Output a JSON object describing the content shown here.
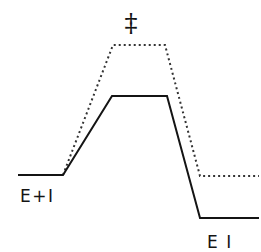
{
  "figure": {
    "name": "reaction-coordinate-diagram",
    "type": "energy-profile",
    "background_color": "#ffffff",
    "line_color": "#141414",
    "dotted_color": "#333333",
    "width": 261,
    "height": 252
  },
  "labels": {
    "transition_state": "‡",
    "reactants": "E+I",
    "products": "E I"
  },
  "label_positions": {
    "transition_state": {
      "x": 131,
      "y": 32
    },
    "reactants": {
      "x": 20,
      "y": 202
    },
    "products": {
      "x": 207,
      "y": 248
    }
  },
  "chart_data": {
    "type": "line",
    "title": "",
    "xlabel": "",
    "ylabel": "",
    "grid": false,
    "legend": "none",
    "axis_visible": false,
    "note": "Enzyme-inhibitor reaction coordinate: solid profile is lower-barrier / more exergonic than dotted profile",
    "series": [
      {
        "name": "solid-profile",
        "style": "solid",
        "color": "#141414",
        "stroke_width": 2,
        "points": [
          {
            "x": 18,
            "y": 175
          },
          {
            "x": 63,
            "y": 175
          },
          {
            "x": 112,
            "y": 96
          },
          {
            "x": 167,
            "y": 96
          },
          {
            "x": 200,
            "y": 218
          },
          {
            "x": 259,
            "y": 218
          }
        ]
      },
      {
        "name": "dotted-profile",
        "style": "dotted",
        "color": "#333333",
        "stroke_width": 2,
        "dash_pattern": "2 3",
        "points": [
          {
            "x": 63,
            "y": 175
          },
          {
            "x": 113,
            "y": 45
          },
          {
            "x": 165,
            "y": 45
          },
          {
            "x": 200,
            "y": 176
          },
          {
            "x": 259,
            "y": 176
          }
        ]
      }
    ],
    "energy_levels": [
      {
        "name": "reactant-baseline-solid",
        "label": "E+I",
        "y": 175
      },
      {
        "name": "transition-state-solid",
        "label": "‡ (solid)",
        "y": 96
      },
      {
        "name": "transition-state-dotted",
        "label": "‡ (dotted)",
        "y": 45
      },
      {
        "name": "product-baseline-solid",
        "label": "E I",
        "y": 218
      },
      {
        "name": "product-baseline-dotted",
        "label": "E I (dotted)",
        "y": 176
      }
    ]
  }
}
